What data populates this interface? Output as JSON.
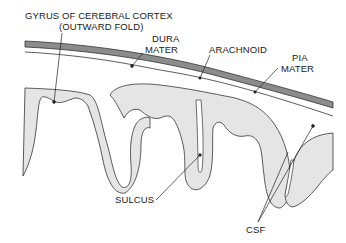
{
  "diagram": {
    "type": "anatomical-cross-section",
    "colors": {
      "background": "#ffffff",
      "dura_fill": "#8a8a8a",
      "cortex_fill": "#e6e6e6",
      "outline": "#333333"
    },
    "labels": {
      "gyrus_line1": "GYRUS OF CEREBRAL CORTEX",
      "gyrus_line2": "(OUTWARD FOLD)",
      "dura_line1": "DURA",
      "dura_line2": "MATER",
      "arachnoid": "ARACHNOID",
      "pia_line1": "PIA",
      "pia_line2": "MATER",
      "sulcus": "SULCUS",
      "csf": "CSF"
    }
  }
}
